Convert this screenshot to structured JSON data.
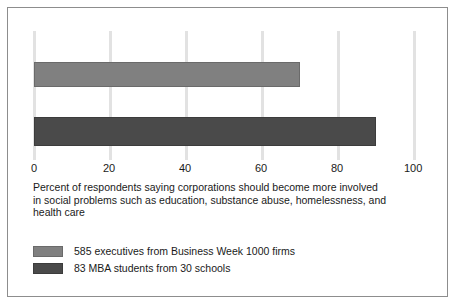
{
  "chart_data": {
    "type": "bar",
    "orientation": "horizontal",
    "title": "",
    "xlabel": "Percent of respondents saying corporations should become more involved in social problems such as education, substance abuse, homelessness, and health care",
    "ylabel": "",
    "xlim": [
      0,
      100
    ],
    "xticks": [
      0,
      20,
      40,
      60,
      80,
      100
    ],
    "xtick_labels": [
      "0",
      "20",
      "40",
      "60",
      "80",
      "100"
    ],
    "grid": true,
    "grid_axis": "x",
    "legend_position": "below",
    "categories": [
      "585 executives from Business Week 1000 firms",
      "83 MBA students from 30 schools"
    ],
    "values": [
      70,
      90
    ],
    "series": [
      {
        "name": "585 executives from Business Week 1000 firms",
        "value": 70,
        "color": "#808080"
      },
      {
        "name": "83 MBA students from 30 schools",
        "value": 90,
        "color": "#4a4a4a"
      }
    ]
  },
  "axis": {
    "ticks": [
      {
        "label": "0",
        "value": 0
      },
      {
        "label": "20",
        "value": 20
      },
      {
        "label": "40",
        "value": 40
      },
      {
        "label": "60",
        "value": 60
      },
      {
        "label": "80",
        "value": 80
      },
      {
        "label": "100",
        "value": 100
      }
    ]
  },
  "caption": {
    "line1": "Percent of respondents saying corporations should become more involved",
    "line2": "in social problems such as education, substance abuse, homelessness, and",
    "line3": "health care"
  },
  "legend": {
    "items": [
      {
        "label": "585 executives from Business Week 1000 firms",
        "color": "#808080"
      },
      {
        "label": "83 MBA students from 30 schools",
        "color": "#4a4a4a"
      }
    ]
  },
  "colors": {
    "bar_light": "#808080",
    "bar_dark": "#4a4a4a",
    "gridline": "#e2e2e2",
    "border": "#8d8d8d",
    "text": "#1a1a1a",
    "background": "#ffffff"
  }
}
